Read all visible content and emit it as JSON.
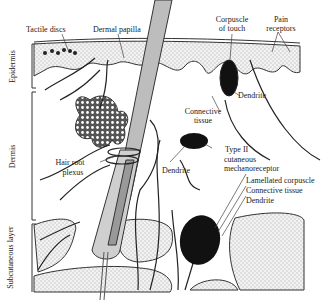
{
  "figure": {
    "type": "skin-cross-section-sensory-receptors",
    "layers": {
      "epidermis": "Epidermis",
      "dermis": "Dermis",
      "subcutaneous": "Subcutaneous layer"
    },
    "labels": {
      "tactile_discs": "Tactile discs",
      "dermal_papilla": "Dermal papilla",
      "corpuscle_of_touch_1": "Corpuscle",
      "corpuscle_of_touch_2": "of touch",
      "pain_receptors_1": "Pain",
      "pain_receptors_2": "receptors",
      "dendrite_touch": "Dendrite",
      "connective_tissue_1": "Connective",
      "connective_tissue_2": "tissue",
      "type2_1": "Type II",
      "type2_2": "cutaneous",
      "type2_3": "mechanoreceptor",
      "dendrite_type2": "Dendrite",
      "hair_root_1": "Hair root",
      "hair_root_2": "plexus",
      "lamellated": "Lamellated corpuscle",
      "connective_tissue_lam": "Connective tissue",
      "dendrite_lam": "Dendrite"
    },
    "colors": {
      "ink": "#222222",
      "stipple": "#d9d9d9",
      "hair": "#bdbdbd",
      "receptor_fill": "#111111"
    }
  }
}
